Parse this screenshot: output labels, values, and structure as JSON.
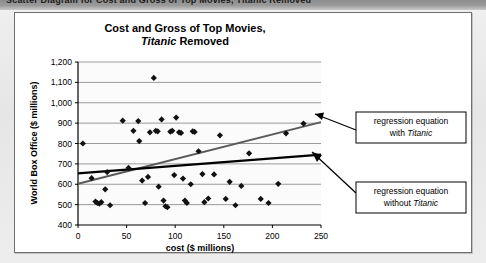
{
  "banner": {
    "text": "Scatter Diagram for Cost and Gross of Top Movies, Titanic Removed"
  },
  "panel": {
    "title_line1": "Cost and Gross of Top Movies,",
    "title_italic": "Titanic",
    "title_line2_rest": " Removed"
  },
  "callouts": {
    "with": {
      "line1": "regression equation",
      "line2_pre": "with ",
      "line2_italic": "Titanic"
    },
    "without": {
      "line1": "regression equation",
      "line2_pre": "without ",
      "line2_italic": "Titanic"
    }
  },
  "colors": {
    "marker": "#111111",
    "line_with_titanic": "#5a5a5a",
    "line_without_titanic": "#000000",
    "gridline": "#9a9a9a",
    "axis": "#000000",
    "panel_bg": "#ffffff",
    "page_bg": "#e9e9e9",
    "banner_bg": "#8e8e8e"
  },
  "chart_data": {
    "type": "scatter",
    "title": "Cost and Gross of Top Movies, Titanic Removed",
    "xlabel": "cost ($ millions)",
    "ylabel": "World Box Office ($ millions)",
    "xlim": [
      0,
      250
    ],
    "ylim": [
      400,
      1200
    ],
    "xticks": [
      0,
      50,
      100,
      150,
      200,
      250
    ],
    "yticks": [
      400,
      500,
      600,
      700,
      800,
      900,
      1000,
      1100,
      1200
    ],
    "ytick_labels": [
      "400",
      "500",
      "600",
      "700",
      "800",
      "900",
      "1,000",
      "1,100",
      "1,200"
    ],
    "grid": "horizontal",
    "legend": "none",
    "marker": "diamond",
    "points": [
      [
        5,
        800
      ],
      [
        14,
        630
      ],
      [
        18,
        515
      ],
      [
        20,
        508
      ],
      [
        22,
        505
      ],
      [
        24,
        512
      ],
      [
        28,
        575
      ],
      [
        30,
        660
      ],
      [
        33,
        497
      ],
      [
        46,
        912
      ],
      [
        52,
        680
      ],
      [
        57,
        862
      ],
      [
        62,
        910
      ],
      [
        63,
        812
      ],
      [
        66,
        618
      ],
      [
        69,
        508
      ],
      [
        72,
        636
      ],
      [
        74,
        855
      ],
      [
        78,
        1122
      ],
      [
        80,
        862
      ],
      [
        82,
        860
      ],
      [
        83,
        588
      ],
      [
        86,
        918
      ],
      [
        88,
        520
      ],
      [
        90,
        492
      ],
      [
        92,
        487
      ],
      [
        95,
        858
      ],
      [
        97,
        862
      ],
      [
        99,
        645
      ],
      [
        101,
        927
      ],
      [
        104,
        855
      ],
      [
        106,
        852
      ],
      [
        108,
        628
      ],
      [
        110,
        520
      ],
      [
        112,
        508
      ],
      [
        116,
        600
      ],
      [
        118,
        860
      ],
      [
        120,
        857
      ],
      [
        124,
        762
      ],
      [
        128,
        650
      ],
      [
        130,
        512
      ],
      [
        134,
        530
      ],
      [
        140,
        648
      ],
      [
        146,
        840
      ],
      [
        152,
        528
      ],
      [
        156,
        612
      ],
      [
        162,
        497
      ],
      [
        168,
        592
      ],
      [
        176,
        752
      ],
      [
        188,
        528
      ],
      [
        196,
        508
      ],
      [
        206,
        602
      ],
      [
        214,
        850
      ],
      [
        232,
        898
      ]
    ],
    "regression_with_titanic": {
      "label": "regression equation with Titanic",
      "x0": 0,
      "y0": 602,
      "x1": 250,
      "y1": 905,
      "color": "#5a5a5a"
    },
    "regression_without_titanic": {
      "label": "regression equation without Titanic",
      "x0": 0,
      "y0": 653,
      "x1": 250,
      "y1": 745,
      "color": "#000000"
    }
  }
}
